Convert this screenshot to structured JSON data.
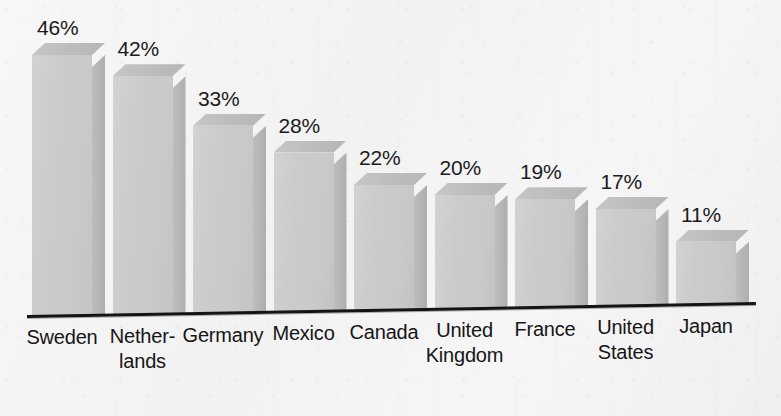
{
  "chart_data": {
    "type": "bar",
    "title": "",
    "subtitle": "",
    "xlabel": "",
    "ylabel": "",
    "ylim": [
      0,
      50
    ],
    "grid": false,
    "legend": false,
    "value_suffix": "%",
    "style": "3d-grayscale-scanned",
    "categories": [
      "Sweden",
      "Netherlands",
      "Germany",
      "Mexico",
      "Canada",
      "United Kingdom",
      "France",
      "United States",
      "Japan"
    ],
    "values": [
      46,
      42,
      33,
      28,
      22,
      20,
      19,
      17,
      11
    ],
    "data_labels": [
      "46%",
      "42%",
      "33%",
      "28%",
      "22%",
      "20%",
      "19%",
      "17%",
      "11%"
    ]
  },
  "axis": {
    "baseline_visible": true,
    "tick_labels": [
      {
        "line1": "Sweden",
        "line2": ""
      },
      {
        "line1": "Nether-",
        "line2": "lands"
      },
      {
        "line1": "Germany",
        "line2": ""
      },
      {
        "line1": "Mexico",
        "line2": ""
      },
      {
        "line1": "Canada",
        "line2": ""
      },
      {
        "line1": "United",
        "line2": "Kingdom"
      },
      {
        "line1": "France",
        "line2": ""
      },
      {
        "line1": "United",
        "line2": "States"
      },
      {
        "line1": "Japan",
        "line2": ""
      }
    ]
  },
  "colors": {
    "background": "#f5f5f5",
    "bar_front": "#cbcbcb",
    "bar_side": "#b4b4b4",
    "bar_top": "#bcbcbc",
    "baseline": "#141414",
    "text": "#161616"
  }
}
